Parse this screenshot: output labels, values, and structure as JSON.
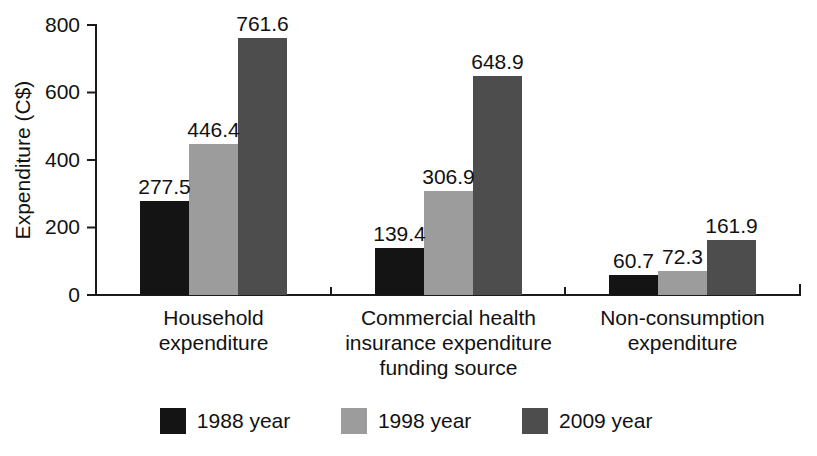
{
  "chart_data": {
    "type": "bar",
    "title": "",
    "subtitle": "",
    "xlabel": "",
    "ylabel": "Expenditure (C$)",
    "ylim": [
      0,
      800
    ],
    "yticks": [
      0,
      200,
      400,
      600,
      800
    ],
    "ytick_labels": [
      "0",
      "200",
      "400",
      "600",
      "800"
    ],
    "grid": false,
    "legend_position": "bottom",
    "value_labels_shown": true,
    "categories": [
      "Household expenditure",
      "Commercial health insurance expenditure funding source",
      "Non-consumption expenditure"
    ],
    "category_lines": [
      [
        "Household",
        "expenditure"
      ],
      [
        "Commercial health",
        "insurance expenditure",
        "funding source"
      ],
      [
        "Non-consumption",
        "expenditure"
      ]
    ],
    "series": [
      {
        "name": "1988 year",
        "color": "#141414",
        "values": [
          277.5,
          139.4,
          60.7
        ],
        "value_labels": [
          "277.5",
          "139.4",
          "60.7"
        ]
      },
      {
        "name": "1998 year",
        "color": "#9c9c9c",
        "values": [
          446.4,
          306.9,
          72.3
        ],
        "value_labels": [
          "446.4",
          "306.9",
          "72.3"
        ]
      },
      {
        "name": "2009 year",
        "color": "#4d4d4d",
        "values": [
          761.6,
          648.9,
          161.9
        ],
        "value_labels": [
          "761.6",
          "648.9",
          "161.9"
        ]
      }
    ]
  },
  "legend": {
    "items": [
      {
        "label": "1988 year",
        "color": "#141414"
      },
      {
        "label": "1998 year",
        "color": "#9c9c9c"
      },
      {
        "label": "2009 year",
        "color": "#4d4d4d"
      }
    ]
  },
  "axis": {
    "y_title": "Expenditure (C$)"
  }
}
